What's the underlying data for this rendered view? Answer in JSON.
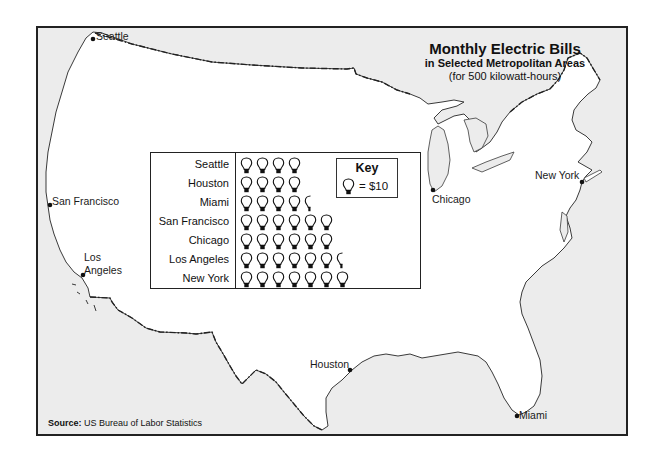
{
  "title": {
    "main": "Monthly Electric Bills",
    "subtitle": "in Selected Metropolitan Areas",
    "note": "(for 500 kilowatt-hours)"
  },
  "source": {
    "label": "Source:",
    "text": "US Bureau of Labor Statistics"
  },
  "colors": {
    "land": "#ffffff",
    "water": "#ececec",
    "border": "#222222",
    "outline": "#333333"
  },
  "cities": [
    {
      "id": "seattle",
      "label": "Seattle"
    },
    {
      "id": "san-francisco",
      "label": "San Francisco"
    },
    {
      "id": "los-angeles",
      "label_line1": "Los",
      "label_line2": "Angeles"
    },
    {
      "id": "chicago",
      "label": "Chicago"
    },
    {
      "id": "new-york",
      "label": "New York"
    },
    {
      "id": "houston",
      "label": "Houston"
    },
    {
      "id": "miami",
      "label": "Miami"
    }
  ],
  "key": {
    "title": "Key",
    "symbol": "lightbulb-icon",
    "value_label": "= $10",
    "dollars_per_symbol": 10
  },
  "chart_data": {
    "type": "pictograph",
    "title": "Monthly Electric Bills in Selected Metropolitan Areas (for 500 kilowatt-hours)",
    "unit": "$",
    "symbol_value": 10,
    "categories": [
      "Seattle",
      "Houston",
      "Miami",
      "San Francisco",
      "Chicago",
      "Los Angeles",
      "New York"
    ],
    "symbols": [
      4,
      4,
      4.5,
      6,
      6,
      6.5,
      7
    ],
    "values": [
      40,
      40,
      45,
      60,
      60,
      65,
      70
    ]
  }
}
